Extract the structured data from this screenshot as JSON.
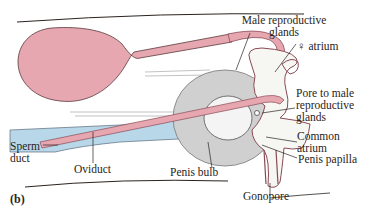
{
  "figure": {
    "panel_label": "(b)",
    "caption_fragment": "… … … …",
    "colors": {
      "pink": "#e7a7b1",
      "pink_outline": "#8a4a55",
      "blue": "#b8d8ea",
      "gray": "#d0d0d0",
      "line": "#2a2420",
      "background": "#ffffff"
    },
    "labels": {
      "male_glands_line1": "Male reproductive",
      "male_glands_line2": "glands",
      "female_atrium": "♀ atrium",
      "pore_line1": "Pore to male",
      "pore_line2": "reproductive",
      "pore_line3": "glands",
      "common_atrium_line1": "Common",
      "common_atrium_line2": "atrium",
      "penis_papilla": "Penis papilla",
      "gonopore": "Gonopore",
      "penis_bulb": "Penis bulb",
      "oviduct": "Oviduct",
      "sperm_duct_line1": "Sperm",
      "sperm_duct_line2": "duct"
    }
  }
}
